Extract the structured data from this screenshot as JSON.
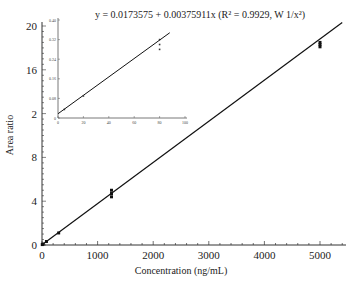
{
  "chart_data": {
    "type": "scatter",
    "title": "y = 0.0173575 + 0.00375911x (R² = 0.9929, W 1/x²)",
    "equation": {
      "intercept": 0.0173575,
      "slope": 0.00375911,
      "r_squared": 0.9929,
      "weighting": "1/x²"
    },
    "main": {
      "xlabel": "Concentration (ng/mL)",
      "ylabel": "Area ratio",
      "xlim": [
        0,
        5400
      ],
      "ylim": [
        0,
        20
      ],
      "x_ticks": [
        0,
        1000,
        2000,
        3000,
        4000,
        5000
      ],
      "y_ticks": [
        0,
        4,
        8,
        12,
        16,
        20
      ],
      "y_tick_labels": [
        "0",
        "4",
        "8",
        "2",
        "16",
        "20"
      ],
      "series": [
        {
          "name": "Calibration standards",
          "x": [
            5,
            20,
            80,
            300,
            1250,
            1250,
            1250,
            5000,
            5000,
            5000
          ],
          "y": [
            0.04,
            0.09,
            0.32,
            1.1,
            4.4,
            4.7,
            5.0,
            18.1,
            18.3,
            18.5
          ]
        }
      ],
      "fit_line": {
        "x": [
          0,
          5400
        ],
        "y": [
          0.0174,
          20.32
        ]
      }
    },
    "inset": {
      "xlim": [
        0,
        100
      ],
      "ylim": [
        0,
        0.4
      ],
      "x_ticks": [
        0,
        20,
        40,
        60,
        80,
        100
      ],
      "y_ticks": [
        0,
        0.08,
        0.16,
        0.24,
        0.32,
        0.4
      ],
      "y_tick_labels": [
        "0",
        "0.08",
        "0.16",
        "0.24",
        "0.32",
        "0.40"
      ],
      "series": [
        {
          "name": "Low standards",
          "x": [
            5,
            20,
            80,
            80,
            80
          ],
          "y": [
            0.035,
            0.09,
            0.28,
            0.3,
            0.32
          ]
        }
      ],
      "fit_line": {
        "x": [
          0,
          88
        ],
        "y": [
          0.0174,
          0.348
        ]
      }
    },
    "legend": null,
    "grid": false
  }
}
